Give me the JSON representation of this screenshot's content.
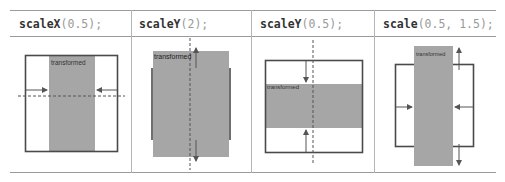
{
  "table": {
    "columns": [
      {
        "fn": "scaleX",
        "args": "(0.5);",
        "figure_label": "transformed"
      },
      {
        "fn": "scaleY",
        "args": "(2);",
        "figure_label": "transformed"
      },
      {
        "fn": "scaleY",
        "args": "(0.5);",
        "figure_label": "transformed"
      },
      {
        "fn": "scale",
        "args": "(0.5, 1.5);",
        "figure_label": "transformed"
      }
    ]
  },
  "colors": {
    "box_border": "#4a4a4a",
    "transformed_fill": "#a6a6a6",
    "arrow": "#555555",
    "grid": "#9a9a9a"
  }
}
